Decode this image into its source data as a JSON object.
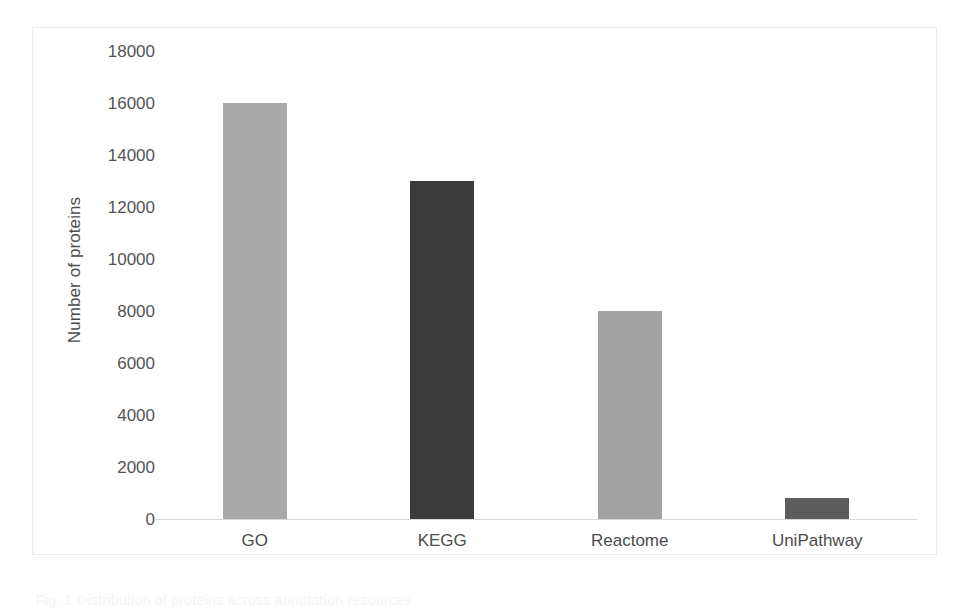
{
  "chart_data": {
    "type": "bar",
    "title": "",
    "xlabel": "",
    "ylabel": "Number of proteins",
    "categories": [
      "GO",
      "KEGG",
      "Reactome",
      "UniPathway"
    ],
    "values": [
      16000,
      13000,
      8000,
      800
    ],
    "series": [
      {
        "name": "Number of proteins",
        "values": [
          16000,
          13000,
          8000,
          800
        ]
      }
    ],
    "bar_colors": [
      "#a9a9a9",
      "#3b3b3b",
      "#a2a2a2",
      "#5c5c5c"
    ],
    "ylim": [
      0,
      18000
    ],
    "ytick_values": [
      0,
      2000,
      4000,
      6000,
      8000,
      10000,
      12000,
      14000,
      16000,
      18000
    ],
    "ytick_labels": [
      "0",
      "2000",
      "4000",
      "6000",
      "8000",
      "10000",
      "12000",
      "14000",
      "16000",
      "18000"
    ],
    "grid": false,
    "legend": false,
    "legend_position": "none",
    "axis_line_color": "#d9d7d7",
    "frame_color": "#eceaea",
    "text_color": "#4c4c4c",
    "background": "#ffffff"
  },
  "caption": {
    "fragment": "Fig. 1 Distribution of proteins across annotation resources"
  }
}
